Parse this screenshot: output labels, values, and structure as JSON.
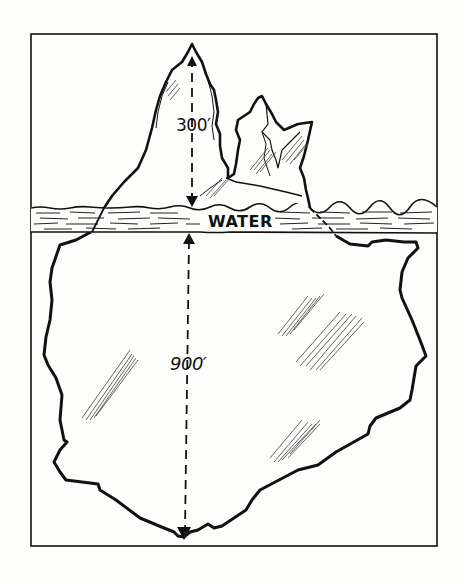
{
  "diagram": {
    "labels": {
      "above_water_height": "300′",
      "below_water_depth": "900′",
      "water": "WATER"
    },
    "colors": {
      "ink": "#111111",
      "paper": "#fdfdfb",
      "hatch": "#555555"
    },
    "measurements": [
      {
        "region": "above water",
        "value": "300′",
        "arrow": "up from waterline to peak"
      },
      {
        "region": "below water",
        "value": "900′",
        "arrow": "down from waterline to base"
      }
    ]
  }
}
